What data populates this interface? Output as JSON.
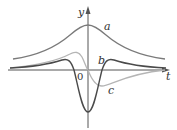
{
  "figure": {
    "type": "function-and-derivatives-graph",
    "axes": {
      "x_label": "t",
      "y_label": "y",
      "origin_label": "0"
    },
    "curves": [
      {
        "id": "a",
        "label": "a",
        "description": "bell-shaped curve, positive, max on y-axis",
        "color": "#7a7a7a"
      },
      {
        "id": "b",
        "label": "b",
        "description": "symmetric curve with deep negative minimum at t=0 and small positive bumps on each side",
        "color": "#4a4a4a"
      },
      {
        "id": "c",
        "label": "c",
        "description": "odd curve, positive for t<0, negative for t>0, passes through origin",
        "color": "#b5b5b5"
      }
    ],
    "colors": {
      "axis": "#555555",
      "text": "#333333",
      "background": "#ffffff"
    }
  }
}
